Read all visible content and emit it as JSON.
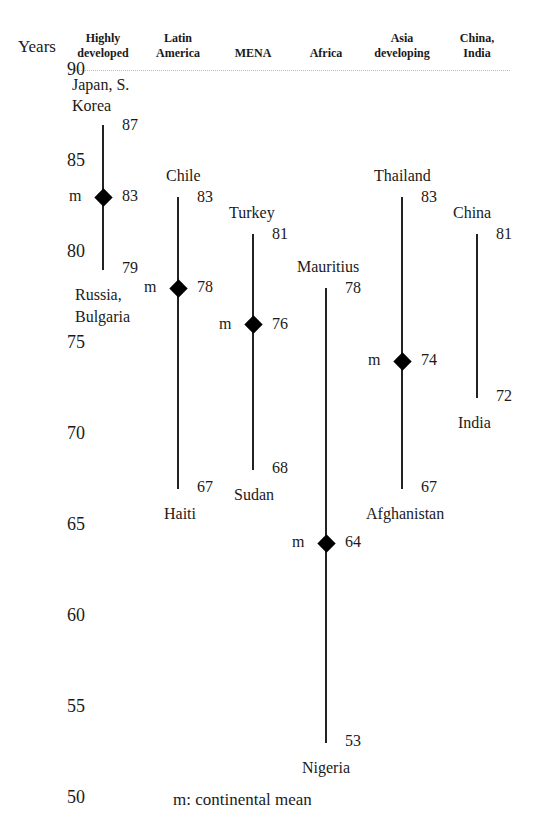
{
  "chart_data": {
    "type": "range",
    "title": "",
    "ylabel": "Years",
    "xlabel": "",
    "ylim": [
      50,
      90
    ],
    "yticks": [
      90,
      85,
      80,
      75,
      70,
      65,
      60,
      55,
      50
    ],
    "grid": false,
    "legend": "m: continental mean",
    "categories": [
      "Highly developed",
      "Latin America",
      "MENA",
      "Africa",
      "Asia developing",
      "China, India"
    ],
    "series": [
      {
        "category": "Highly developed",
        "header": [
          "Highly",
          "developed"
        ],
        "max": 87,
        "max_label": [
          "Japan, S.",
          "Korea"
        ],
        "min": 79,
        "min_label": [
          "Russia,",
          "Bulgaria"
        ],
        "mean": 83
      },
      {
        "category": "Latin America",
        "header": [
          "Latin",
          "America"
        ],
        "max": 83,
        "max_label": [
          "Chile"
        ],
        "min": 67,
        "min_label": [
          "Haiti"
        ],
        "mean": 78
      },
      {
        "category": "MENA",
        "header": [
          "",
          "MENA"
        ],
        "max": 81,
        "max_label": [
          "Turkey"
        ],
        "min": 68,
        "min_label": [
          "Sudan"
        ],
        "mean": 76
      },
      {
        "category": "Africa",
        "header": [
          "",
          "Africa"
        ],
        "max": 78,
        "max_label": [
          "Mauritius"
        ],
        "min": 53,
        "min_label": [
          "Nigeria"
        ],
        "mean": 64
      },
      {
        "category": "Asia developing",
        "header": [
          "Asia",
          "developing"
        ],
        "max": 83,
        "max_label": [
          "Thailand"
        ],
        "min": 67,
        "min_label": [
          "Afghanistan"
        ],
        "mean": 74
      },
      {
        "category": "China, India",
        "header": [
          "China,",
          "India"
        ],
        "max": 81,
        "max_label": [
          "China"
        ],
        "min": 72,
        "min_label": [
          "India"
        ],
        "mean": null
      }
    ]
  },
  "labels": {
    "y_axis_title": "Years",
    "mean_marker": "m",
    "legend": "m: continental mean"
  },
  "colors": {
    "line": "#222222",
    "marker": "#000000",
    "text": "#1a1a1a",
    "baseline": "#bdbdbd"
  }
}
